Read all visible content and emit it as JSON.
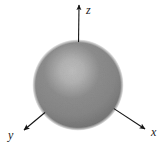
{
  "figure": {
    "kind": "diagram",
    "background_color": "#ffffff",
    "width": 166,
    "height": 148
  },
  "sphere": {
    "name": "sphere",
    "center_x": 78,
    "center_y": 85,
    "radius": 45,
    "fill_style": "radial-gradient",
    "highlight_color": "#bdbdbd",
    "mid_color": "#8d8d8d",
    "edge_color": "#5f5f5f",
    "highlight_offset_x": -6,
    "highlight_offset_y": -14
  },
  "axes": {
    "line_color": "#141414",
    "line_width": 1.1,
    "items": [
      {
        "id": "z",
        "label": "z",
        "start_x": 79,
        "start_y": 88,
        "end_x": 79,
        "end_y": 9,
        "tip_x": 79,
        "tip_y": 5,
        "label_x": 86,
        "label_y": 14,
        "direction": "up"
      },
      {
        "id": "x",
        "label": "x",
        "start_x": 82,
        "start_y": 90,
        "end_x": 140,
        "end_y": 126,
        "tip_x": 145,
        "tip_y": 129,
        "label_x": 151,
        "label_y": 136,
        "direction": "down-right"
      },
      {
        "id": "y",
        "label": "y",
        "start_x": 75,
        "start_y": 90,
        "end_x": 29,
        "end_y": 126,
        "tip_x": 24,
        "tip_y": 130,
        "label_x": 8,
        "label_y": 139,
        "direction": "down-left"
      }
    ]
  }
}
